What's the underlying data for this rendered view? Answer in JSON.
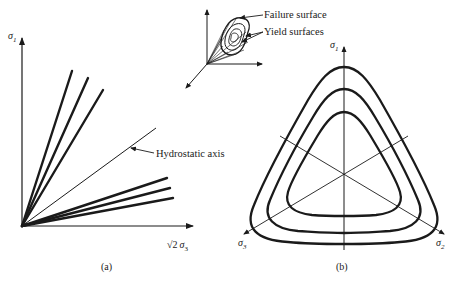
{
  "panel_a": {
    "caption": "(a)",
    "y_axis_label": "σ",
    "y_axis_sub": "1",
    "x_axis_label_prefix": "√2",
    "x_axis_label": "σ",
    "x_axis_sub": "3",
    "hydrostatic_label": "Hydrostatic axis",
    "upper_meridians": 3,
    "lower_meridians": 3
  },
  "inset_3d": {
    "failure_label": "Failure surface",
    "yield_label": "Yield surfaces"
  },
  "panel_b": {
    "caption": "(b)",
    "axis1_label": "σ",
    "axis1_sub": "1",
    "axis2_label": "σ",
    "axis2_sub": "2",
    "axis3_label": "σ",
    "axis3_sub": "3",
    "contour_count": 3
  },
  "colors": {
    "ink": "#1a1a1a",
    "background": "#ffffff"
  }
}
